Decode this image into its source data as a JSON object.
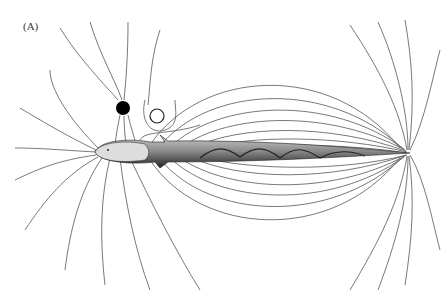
{
  "figure": {
    "panel_label": "(A)",
    "objects": [
      {
        "name": "conductive-object",
        "fill": "#000000",
        "description": "filled black circle distorting field lines toward it"
      },
      {
        "name": "insulating-object",
        "fill": "#ffffff",
        "description": "hollow circle deflecting field lines around it"
      }
    ],
    "colors": {
      "lines": "#555555",
      "background": "#ffffff",
      "fish": "#333333"
    }
  }
}
